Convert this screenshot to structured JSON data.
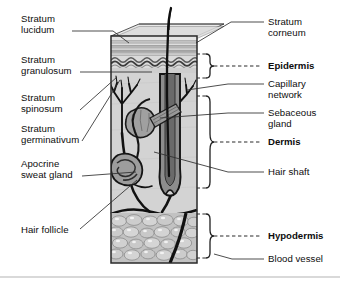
{
  "diagram": {
    "illustration_style": "grayscale textbook cross-section block",
    "colors": {
      "background": "#ffffff",
      "text": "#0d0d0d",
      "leader_line": "#2b2b2b",
      "outline": "#111111",
      "epidermis_band_light": "#d7d7d7",
      "epidermis_band_mid": "#b8b8b8",
      "epidermis_band_dark": "#8f8f8f",
      "dermis_fill": "#d2d2d2",
      "hypodermis_fill": "#bfbfbf",
      "fat_cell_fill": "#cfcfcf",
      "fat_cell_highlight": "#f2f2f2",
      "gland_fill": "#9a9a9a",
      "follicle_fill": "#8a8a8a",
      "hair_color": "#141414",
      "baseline_rule": "#d9d9d9"
    }
  },
  "labels_left": [
    {
      "id": "stratum-lucidum",
      "text": "Stratum\nlucidum"
    },
    {
      "id": "stratum-granulosum",
      "text": "Stratum\ngranulosum"
    },
    {
      "id": "stratum-spinosum",
      "text": "Stratum\nspinosum"
    },
    {
      "id": "stratum-germinativum",
      "text": "Stratum\ngerminativum"
    },
    {
      "id": "apocrine-sweat-gland",
      "text": "Apocrine\nsweat gland"
    },
    {
      "id": "hair-follicle",
      "text": "Hair follicle"
    }
  ],
  "labels_right": [
    {
      "id": "stratum-corneum",
      "text": "Stratum\ncorneum",
      "bold": false
    },
    {
      "id": "epidermis",
      "text": "Epidermis",
      "bold": true
    },
    {
      "id": "capillary-network",
      "text": "Capillary\nnetwork",
      "bold": false
    },
    {
      "id": "sebaceous-gland",
      "text": "Sebaceous\ngland",
      "bold": false
    },
    {
      "id": "dermis",
      "text": "Dermis",
      "bold": true
    },
    {
      "id": "hair-shaft",
      "text": "Hair shaft",
      "bold": false
    },
    {
      "id": "hypodermis",
      "text": "Hypodermis",
      "bold": true
    },
    {
      "id": "blood-vessel",
      "text": "Blood vessel",
      "bold": false
    }
  ],
  "layers": [
    {
      "id": "epidermis",
      "name": "Epidermis",
      "sublayers": [
        "Stratum corneum",
        "Stratum lucidum",
        "Stratum granulosum",
        "Stratum spinosum",
        "Stratum germinativum"
      ]
    },
    {
      "id": "dermis",
      "name": "Dermis",
      "structures": [
        "Capillary network",
        "Sebaceous gland",
        "Hair shaft",
        "Hair follicle",
        "Apocrine sweat gland"
      ]
    },
    {
      "id": "hypodermis",
      "name": "Hypodermis",
      "structures": [
        "Blood vessel",
        "Adipose (fat) cells"
      ]
    }
  ]
}
